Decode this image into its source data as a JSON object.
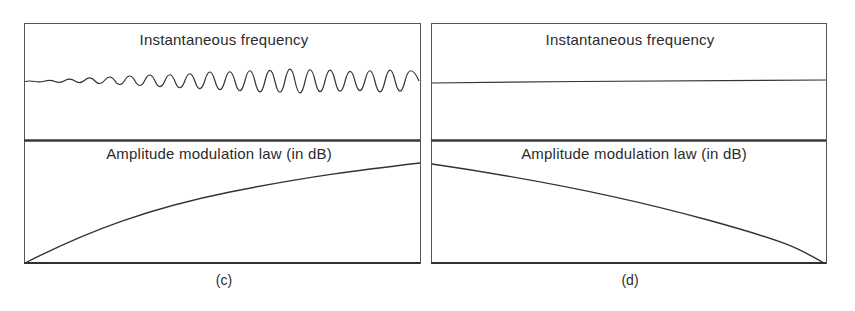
{
  "figure": {
    "panels": [
      {
        "id": "c",
        "caption": "(c)",
        "top_title": "Instantaneous frequency",
        "bottom_title": "Amplitude modulation law (in dB)",
        "frequency_trace": "constant with small ripple",
        "amplitude_trace": "increasing, concave (rising from bottom-left to top-right)"
      },
      {
        "id": "d",
        "caption": "(d)",
        "top_title": "Instantaneous frequency",
        "bottom_title": "Amplitude modulation law (in dB)",
        "frequency_trace": "constant (flat line)",
        "amplitude_trace": "decreasing, concave (falling from top-left to bottom-right)"
      }
    ],
    "colors": {
      "ink": "#2a2a2a",
      "background": "#ffffff"
    }
  }
}
